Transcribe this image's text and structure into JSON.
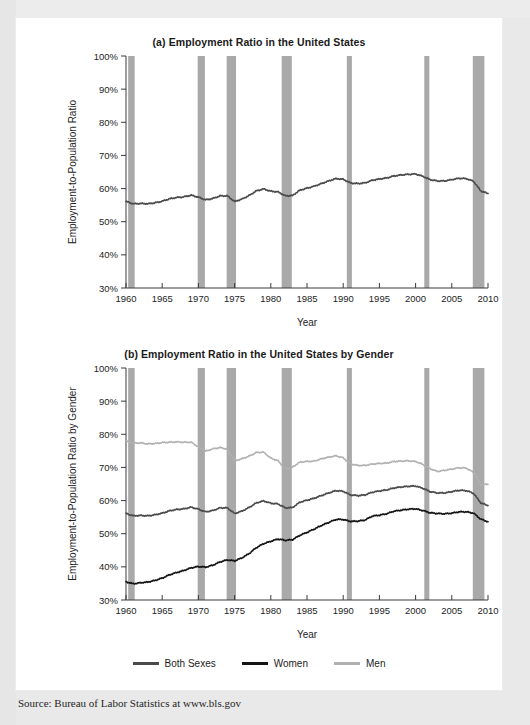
{
  "source": {
    "text": "Source: Bureau of Labor Statistics at www.bls.gov"
  },
  "legend": {
    "items": [
      {
        "label": "Both Sexes",
        "color": "#4a4a4a"
      },
      {
        "label": "Women",
        "color": "#141414"
      },
      {
        "label": "Men",
        "color": "#b0b0b0"
      }
    ]
  },
  "chart_data": [
    {
      "id": "a",
      "type": "line",
      "title": "(a) Employment Ratio in the United States",
      "xlabel": "Year",
      "ylabel": "Employment-to-Population Ratio",
      "xlim": [
        1960,
        2010
      ],
      "ylim": [
        30,
        100
      ],
      "xticks": [
        1960,
        1965,
        1970,
        1975,
        1980,
        1985,
        1990,
        1995,
        2000,
        2005,
        2010
      ],
      "yticks": [
        30,
        40,
        50,
        60,
        70,
        80,
        90,
        100
      ],
      "ytick_labels": [
        "30%",
        "40%",
        "50%",
        "60%",
        "70%",
        "80%",
        "90%",
        "100%"
      ],
      "grid": false,
      "legend_position": "below-figure-b",
      "recessions": [
        [
          1960.3,
          1961.2
        ],
        [
          1969.9,
          1970.9
        ],
        [
          1973.9,
          1975.2
        ],
        [
          1981.5,
          1982.9
        ],
        [
          1990.5,
          1991.2
        ],
        [
          2001.2,
          2001.9
        ],
        [
          2007.9,
          2009.5
        ]
      ],
      "series": [
        {
          "name": "Both Sexes",
          "color": "#4a4a4a",
          "width": 1.6,
          "x": [
            1960,
            1961,
            1962,
            1963,
            1964,
            1965,
            1966,
            1967,
            1968,
            1969,
            1970,
            1971,
            1972,
            1973,
            1974,
            1975,
            1976,
            1977,
            1978,
            1979,
            1980,
            1981,
            1982,
            1983,
            1984,
            1985,
            1986,
            1987,
            1988,
            1989,
            1990,
            1991,
            1992,
            1993,
            1994,
            1995,
            1996,
            1997,
            1998,
            1999,
            2000,
            2001,
            2002,
            2003,
            2004,
            2005,
            2006,
            2007,
            2008,
            2009,
            2010
          ],
          "values": [
            56.1,
            55.4,
            55.5,
            55.4,
            55.7,
            56.2,
            56.9,
            57.3,
            57.5,
            58.0,
            57.4,
            56.6,
            57.0,
            57.8,
            57.8,
            56.1,
            56.8,
            57.9,
            59.3,
            59.9,
            59.2,
            59.0,
            57.8,
            57.9,
            59.5,
            60.1,
            60.7,
            61.5,
            62.3,
            63.0,
            62.8,
            61.7,
            61.5,
            61.7,
            62.5,
            62.9,
            63.2,
            63.8,
            64.1,
            64.3,
            64.4,
            63.7,
            62.7,
            62.3,
            62.3,
            62.7,
            63.1,
            63.0,
            62.2,
            59.3,
            58.5
          ]
        }
      ]
    },
    {
      "id": "b",
      "type": "line",
      "title": "(b) Employment Ratio in the United States by Gender",
      "xlabel": "Year",
      "ylabel": "Employment-to-Population Ratio by Gender",
      "xlim": [
        1960,
        2010
      ],
      "ylim": [
        30,
        100
      ],
      "xticks": [
        1960,
        1965,
        1970,
        1975,
        1980,
        1985,
        1990,
        1995,
        2000,
        2005,
        2010
      ],
      "yticks": [
        30,
        40,
        50,
        60,
        70,
        80,
        90,
        100
      ],
      "ytick_labels": [
        "30%",
        "40%",
        "50%",
        "60%",
        "70%",
        "80%",
        "90%",
        "100%"
      ],
      "grid": false,
      "legend_position": "bottom-center",
      "recessions": [
        [
          1960.3,
          1961.2
        ],
        [
          1969.9,
          1970.9
        ],
        [
          1973.9,
          1975.2
        ],
        [
          1981.5,
          1982.9
        ],
        [
          1990.5,
          1991.2
        ],
        [
          2001.2,
          2001.9
        ],
        [
          2007.9,
          2009.5
        ]
      ],
      "series": [
        {
          "name": "Men",
          "color": "#b0b0b0",
          "width": 1.5,
          "x": [
            1960,
            1961,
            1962,
            1963,
            1964,
            1965,
            1966,
            1967,
            1968,
            1969,
            1970,
            1971,
            1972,
            1973,
            1974,
            1975,
            1976,
            1977,
            1978,
            1979,
            1980,
            1981,
            1982,
            1983,
            1984,
            1985,
            1986,
            1987,
            1988,
            1989,
            1990,
            1991,
            1992,
            1993,
            1994,
            1995,
            1996,
            1997,
            1998,
            1999,
            2000,
            2001,
            2002,
            2003,
            2004,
            2005,
            2006,
            2007,
            2008,
            2009,
            2010
          ],
          "values": [
            78.0,
            77.3,
            77.4,
            77.1,
            77.2,
            77.5,
            77.6,
            77.7,
            77.6,
            77.6,
            76.2,
            74.9,
            75.6,
            76.0,
            75.5,
            72.0,
            72.6,
            73.4,
            74.5,
            74.6,
            72.8,
            72.0,
            69.5,
            70.1,
            71.6,
            71.8,
            71.9,
            72.6,
            73.1,
            73.5,
            72.9,
            71.1,
            70.6,
            70.6,
            71.0,
            71.2,
            71.3,
            71.8,
            71.9,
            72.0,
            71.8,
            70.9,
            69.6,
            68.8,
            69.1,
            69.5,
            69.9,
            69.8,
            68.5,
            64.8,
            64.9
          ]
        },
        {
          "name": "Both Sexes",
          "color": "#4a4a4a",
          "width": 1.6,
          "x": [
            1960,
            1961,
            1962,
            1963,
            1964,
            1965,
            1966,
            1967,
            1968,
            1969,
            1970,
            1971,
            1972,
            1973,
            1974,
            1975,
            1976,
            1977,
            1978,
            1979,
            1980,
            1981,
            1982,
            1983,
            1984,
            1985,
            1986,
            1987,
            1988,
            1989,
            1990,
            1991,
            1992,
            1993,
            1994,
            1995,
            1996,
            1997,
            1998,
            1999,
            2000,
            2001,
            2002,
            2003,
            2004,
            2005,
            2006,
            2007,
            2008,
            2009,
            2010
          ],
          "values": [
            56.1,
            55.4,
            55.5,
            55.4,
            55.7,
            56.2,
            56.9,
            57.3,
            57.5,
            58.0,
            57.4,
            56.6,
            57.0,
            57.8,
            57.8,
            56.1,
            56.8,
            57.9,
            59.3,
            59.9,
            59.2,
            59.0,
            57.8,
            57.9,
            59.5,
            60.1,
            60.7,
            61.5,
            62.3,
            63.0,
            62.8,
            61.7,
            61.5,
            61.7,
            62.5,
            62.9,
            63.2,
            63.8,
            64.1,
            64.3,
            64.4,
            63.7,
            62.7,
            62.3,
            62.3,
            62.7,
            63.1,
            63.0,
            62.2,
            59.3,
            58.5
          ]
        },
        {
          "name": "Women",
          "color": "#141414",
          "width": 1.6,
          "x": [
            1960,
            1961,
            1962,
            1963,
            1964,
            1965,
            1966,
            1967,
            1968,
            1969,
            1970,
            1971,
            1972,
            1973,
            1974,
            1975,
            1976,
            1977,
            1978,
            1979,
            1980,
            1981,
            1982,
            1983,
            1984,
            1985,
            1986,
            1987,
            1988,
            1989,
            1990,
            1991,
            1992,
            1993,
            1994,
            1995,
            1996,
            1997,
            1998,
            1999,
            2000,
            2001,
            2002,
            2003,
            2004,
            2005,
            2006,
            2007,
            2008,
            2009,
            2010
          ],
          "values": [
            35.5,
            34.9,
            35.2,
            35.4,
            35.9,
            36.6,
            37.6,
            38.3,
            38.9,
            39.7,
            40.1,
            39.9,
            40.5,
            41.5,
            42.1,
            41.8,
            42.7,
            44.0,
            45.8,
            47.0,
            47.7,
            48.4,
            48.0,
            48.2,
            49.5,
            50.4,
            51.4,
            52.5,
            53.4,
            54.3,
            54.3,
            53.7,
            53.8,
            54.1,
            55.3,
            55.6,
            56.0,
            56.8,
            57.1,
            57.4,
            57.5,
            57.0,
            56.3,
            56.1,
            56.0,
            56.2,
            56.6,
            56.6,
            56.2,
            54.4,
            53.6
          ]
        }
      ]
    }
  ]
}
